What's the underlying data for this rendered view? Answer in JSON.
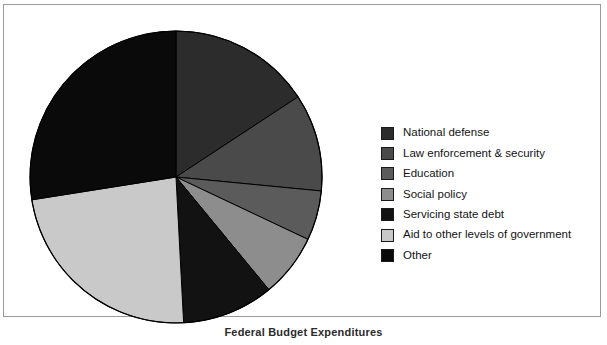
{
  "chart_data": {
    "type": "pie",
    "title": "",
    "subtitle": "",
    "xlabel": "",
    "ylabel": "",
    "legend_position": "right",
    "grid": false,
    "start_angle_deg": 0,
    "direction": "clockwise",
    "categories": [
      "National defense",
      "Law enforcement & security",
      "Education",
      "Social policy",
      "Servicing state debt",
      "Aid to other levels of government",
      "Other"
    ],
    "values": [
      15.8,
      10.8,
      5.5,
      7.0,
      10.1,
      23.3,
      27.5
    ],
    "units": "percent",
    "slice_angles_deg": [
      56.7,
      38.8,
      19.8,
      25.2,
      36.5,
      84.0,
      99.0
    ],
    "boundary_angles_deg": [
      0,
      56.7,
      95.5,
      115.3,
      140.5,
      177.0,
      261.0,
      360.0
    ],
    "colors": [
      "#2c2c2c",
      "#4a4a4a",
      "#5b5b5b",
      "#8d8d8d",
      "#121212",
      "#c9c9c9",
      "#0a0a0a"
    ],
    "slices": [
      {
        "label": "National defense",
        "value": 15.8,
        "angle_deg": 56.7,
        "color": "#2c2c2c"
      },
      {
        "label": "Law enforcement & security",
        "value": 10.8,
        "angle_deg": 38.8,
        "color": "#4a4a4a"
      },
      {
        "label": "Education",
        "value": 5.5,
        "angle_deg": 19.8,
        "color": "#5b5b5b"
      },
      {
        "label": "Social policy",
        "value": 7.0,
        "angle_deg": 25.2,
        "color": "#8d8d8d"
      },
      {
        "label": "Servicing state debt",
        "value": 10.1,
        "angle_deg": 36.5,
        "color": "#121212"
      },
      {
        "label": "Aid to other levels of government",
        "value": 23.3,
        "angle_deg": 84.0,
        "color": "#c9c9c9"
      },
      {
        "label": "Other",
        "value": 27.5,
        "angle_deg": 99.0,
        "color": "#0a0a0a"
      }
    ]
  },
  "legend": {
    "items": [
      {
        "label": "National defense",
        "color": "#2c2c2c"
      },
      {
        "label": "Law enforcement & security",
        "color": "#4a4a4a"
      },
      {
        "label": "Education",
        "color": "#5b5b5b"
      },
      {
        "label": "Social policy",
        "color": "#8d8d8d"
      },
      {
        "label": "Servicing state debt",
        "color": "#121212"
      },
      {
        "label": "Aid to other levels of government",
        "color": "#c9c9c9"
      },
      {
        "label": "Other",
        "color": "#0a0a0a"
      }
    ]
  },
  "footer": {
    "caption": "Federal Budget Expenditures"
  },
  "geometry": {
    "center_x": 147,
    "center_y": 152,
    "radius": 146
  }
}
